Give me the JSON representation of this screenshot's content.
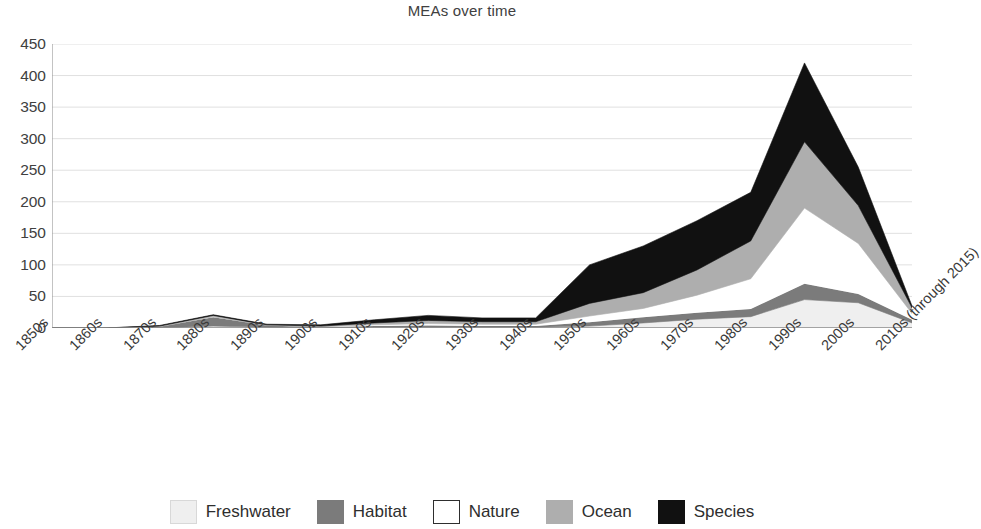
{
  "chart_data": {
    "type": "area",
    "stacked": true,
    "title": "MEAs over time",
    "xlabel": "",
    "ylabel": "",
    "ylim": [
      0,
      450
    ],
    "ytick_step": 50,
    "yticks": [
      450,
      400,
      350,
      300,
      250,
      200,
      150,
      100,
      50,
      0
    ],
    "grid": true,
    "grid_axis": "y",
    "legend_position": "bottom",
    "xtick_rotation": -45,
    "categories": [
      "1850s",
      "1860s",
      "1870s",
      "1880s",
      "1890s",
      "1900s",
      "1910s",
      "1920s",
      "1930s",
      "1940s",
      "1950s",
      "1960s",
      "1970s",
      "1980s",
      "1990s",
      "2000s",
      "2010s (through 2015)"
    ],
    "series": [
      {
        "name": "Freshwater",
        "color": "#efefef",
        "values": [
          0,
          0,
          0,
          3,
          1,
          0,
          1,
          1,
          1,
          1,
          3,
          8,
          14,
          18,
          45,
          40,
          8
        ]
      },
      {
        "name": "Habitat",
        "color": "#7b7b7b",
        "values": [
          0,
          0,
          2,
          14,
          3,
          1,
          2,
          3,
          2,
          2,
          6,
          9,
          10,
          12,
          25,
          14,
          5
        ]
      },
      {
        "name": "Nature",
        "color": "#ffffff",
        "values": [
          0,
          0,
          0,
          1,
          0,
          1,
          2,
          3,
          3,
          3,
          10,
          14,
          28,
          48,
          120,
          80,
          10
        ]
      },
      {
        "name": "Ocean",
        "color": "#aeaeae",
        "values": [
          0,
          0,
          1,
          2,
          1,
          1,
          3,
          5,
          4,
          4,
          20,
          25,
          40,
          60,
          105,
          60,
          9
        ]
      },
      {
        "name": "Species",
        "color": "#111111",
        "values": [
          0,
          0,
          1,
          1,
          1,
          2,
          5,
          8,
          6,
          6,
          61,
          74,
          78,
          77,
          125,
          61,
          3
        ]
      }
    ],
    "totals": [
      0,
      0,
      4,
      21,
      6,
      5,
      13,
      20,
      16,
      16,
      100,
      130,
      170,
      215,
      420,
      255,
      35
    ]
  },
  "legend": {
    "items": [
      {
        "label": "Freshwater",
        "swatch": "#efefef",
        "border": "#d8d8d8"
      },
      {
        "label": "Habitat",
        "swatch": "#7b7b7b",
        "border": "#7b7b7b"
      },
      {
        "label": "Nature",
        "swatch": "#ffffff",
        "border": "#2e2e2e"
      },
      {
        "label": "Ocean",
        "swatch": "#aeaeae",
        "border": "#aeaeae"
      },
      {
        "label": "Species",
        "swatch": "#111111",
        "border": "#111111"
      }
    ]
  }
}
